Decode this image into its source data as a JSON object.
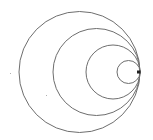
{
  "diagram": {
    "type": "tangent-circles",
    "stroke_color": "#6e6e6e",
    "stroke_width": 1,
    "background": "#ffffff",
    "tangent_point": {
      "x": 140,
      "y": 72,
      "color": "#222222"
    },
    "circles": [
      {
        "cx": 79.5,
        "cy": 72,
        "r": 60.5
      },
      {
        "cx": 96.5,
        "cy": 72,
        "r": 43.5
      },
      {
        "cx": 113,
        "cy": 72,
        "r": 27
      },
      {
        "cx": 128.5,
        "cy": 72,
        "r": 11.5
      }
    ],
    "specks": [
      {
        "x": 10,
        "y": 73
      },
      {
        "x": 46,
        "y": 95
      }
    ]
  }
}
